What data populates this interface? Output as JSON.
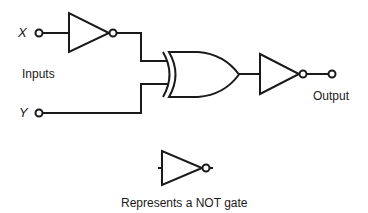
{
  "diagram": {
    "type": "logic-circuit",
    "labels": {
      "input_x": "X",
      "input_y": "Y",
      "inputs": "Inputs",
      "output": "Output",
      "legend": "Represents a NOT gate"
    },
    "components": [
      {
        "id": "not1",
        "kind": "NOT",
        "input": "X"
      },
      {
        "id": "xor1",
        "kind": "XOR",
        "inputs": [
          "not1",
          "Y"
        ]
      },
      {
        "id": "not2",
        "kind": "NOT",
        "input": "xor1",
        "output": "Output"
      }
    ],
    "legend_symbol": "NOT",
    "stroke_color": "#1a1a1a"
  }
}
